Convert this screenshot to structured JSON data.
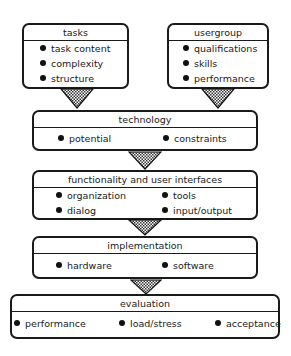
{
  "diagram": {
    "tasks": {
      "title": "tasks",
      "items": [
        "task content",
        "complexity",
        "structure"
      ]
    },
    "usergroup": {
      "title": "usergroup",
      "items": [
        "qualifications",
        "skills",
        "performance"
      ]
    },
    "technology": {
      "title": "technology",
      "items": [
        "potential",
        "constraints"
      ]
    },
    "functionality": {
      "title": "functionality and user interfaces",
      "items": [
        "organization",
        "tools",
        "dialog",
        "input/output"
      ]
    },
    "implementation": {
      "title": "implementation",
      "items": [
        "hardware",
        "software"
      ]
    },
    "evaluation": {
      "title": "evaluation",
      "items": [
        "performance",
        "load/stress",
        "acceptance"
      ]
    }
  }
}
